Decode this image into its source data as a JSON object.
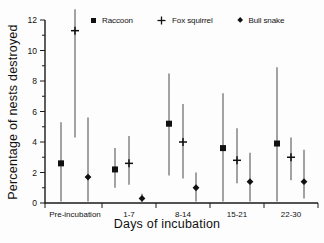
{
  "figure": {
    "background": "#fdfdfd",
    "text_color": "#111111",
    "error_bar_color": "#666666",
    "marker_color": "#111111"
  },
  "chart_data": {
    "type": "scatter",
    "title": "",
    "xlabel": "Days of incubation",
    "ylabel": "Percentage of nests destroyed",
    "ylim": [
      0,
      12
    ],
    "y_major_ticks": [
      0,
      2,
      4,
      6,
      8,
      10,
      12
    ],
    "y_minor_ticks": [
      1,
      3,
      5,
      7,
      9,
      11
    ],
    "categories": [
      "Pre-incubation",
      "1-7",
      "8-14",
      "15-21",
      "22-30"
    ],
    "grid": false,
    "legend_position": "top",
    "error_bars": "95% CI vertical lines",
    "series": [
      {
        "name": "Raccoon",
        "marker": "filled-square",
        "values": [
          2.6,
          2.2,
          5.2,
          3.6,
          3.9
        ],
        "ci_low": [
          0.1,
          1.0,
          1.8,
          0.1,
          0.1
        ],
        "ci_high": [
          5.3,
          3.6,
          8.5,
          7.2,
          8.9
        ]
      },
      {
        "name": "Fox squirrel",
        "marker": "plus",
        "values": [
          11.3,
          2.6,
          4.0,
          2.8,
          3.0
        ],
        "ci_low": [
          4.3,
          1.2,
          1.6,
          1.3,
          1.5
        ],
        "ci_high": [
          12.7,
          4.4,
          6.5,
          4.9,
          4.3
        ]
      },
      {
        "name": "Bull snake",
        "marker": "filled-diamond",
        "values": [
          1.7,
          0.3,
          1.0,
          1.4,
          1.4
        ],
        "ci_low": [
          0.1,
          0.0,
          0.1,
          0.1,
          0.3
        ],
        "ci_high": [
          5.6,
          0.6,
          2.0,
          3.3,
          3.5
        ]
      }
    ]
  }
}
